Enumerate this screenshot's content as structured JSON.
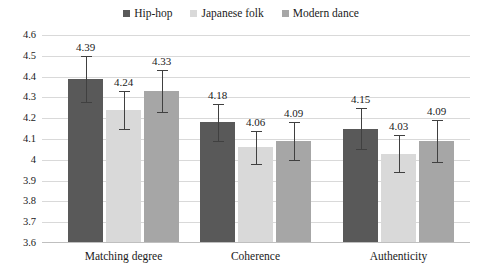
{
  "chart_data": {
    "type": "bar",
    "title": "",
    "xlabel": "",
    "ylabel": "",
    "ylim": [
      3.6,
      4.6
    ],
    "ytick_step": 0.1,
    "yticks": [
      "4.6",
      "4.5",
      "4.4",
      "4.3",
      "4.2",
      "4.1",
      "4",
      "3.9",
      "3.8",
      "3.7",
      "3.6"
    ],
    "grid": true,
    "legend_position": "top-center",
    "categories": [
      "Matching degree",
      "Coherence",
      "Authenticity"
    ],
    "series": [
      {
        "name": "Hip-hop",
        "color": "#595959",
        "values": [
          4.39,
          4.24,
          4.15
        ],
        "labels": [
          "4.39",
          "4.18",
          "4.15"
        ],
        "errors": [
          0.11,
          0.09,
          0.1
        ]
      },
      {
        "name": "Japanese folk",
        "color": "#d9d9d9",
        "values": [
          4.24,
          4.06,
          4.03
        ],
        "labels": [
          "4.24",
          "4.06",
          "4.03"
        ],
        "errors": [
          0.09,
          0.08,
          0.09
        ]
      },
      {
        "name": "Modern dance",
        "color": "#a6a6a6",
        "values": [
          4.33,
          4.09,
          4.09
        ],
        "labels": [
          "4.33",
          "4.09",
          "4.09"
        ],
        "errors": [
          0.1,
          0.09,
          0.1
        ]
      }
    ],
    "groups": [
      {
        "category": "Matching degree",
        "bars": [
          {
            "series": "Hip-hop",
            "value": 4.39,
            "label": "4.39",
            "error": 0.11
          },
          {
            "series": "Japanese folk",
            "value": 4.24,
            "label": "4.24",
            "error": 0.09
          },
          {
            "series": "Modern dance",
            "value": 4.33,
            "label": "4.33",
            "error": 0.1
          }
        ]
      },
      {
        "category": "Coherence",
        "bars": [
          {
            "series": "Hip-hop",
            "value": 4.18,
            "label": "4.18",
            "error": 0.09
          },
          {
            "series": "Japanese folk",
            "value": 4.06,
            "label": "4.06",
            "error": 0.08
          },
          {
            "series": "Modern dance",
            "value": 4.09,
            "label": "4.09",
            "error": 0.09
          }
        ]
      },
      {
        "category": "Authenticity",
        "bars": [
          {
            "series": "Hip-hop",
            "value": 4.15,
            "label": "4.15",
            "error": 0.1
          },
          {
            "series": "Japanese folk",
            "value": 4.03,
            "label": "4.03",
            "error": 0.09
          },
          {
            "series": "Modern dance",
            "value": 4.09,
            "label": "4.09",
            "error": 0.1
          }
        ]
      }
    ]
  },
  "legend": {
    "items": [
      {
        "label": "Hip-hop",
        "color": "#595959"
      },
      {
        "label": "Japanese folk",
        "color": "#d9d9d9"
      },
      {
        "label": "Modern dance",
        "color": "#a6a6a6"
      }
    ]
  },
  "axes": {
    "y": {
      "ticks": [
        "4.6",
        "4.5",
        "4.4",
        "4.3",
        "4.2",
        "4.1",
        "4",
        "3.9",
        "3.8",
        "3.7",
        "3.6"
      ]
    },
    "x": {
      "ticks": [
        "Matching degree",
        "Coherence",
        "Authenticity"
      ]
    }
  },
  "colors": {
    "gridline": "#d9d9d9",
    "axis": "#bfbfbf",
    "error_bar": "#404040",
    "text": "#1a1a1a",
    "background": "#ffffff"
  }
}
